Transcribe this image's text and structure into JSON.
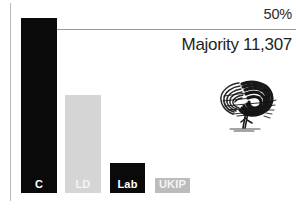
{
  "chart_data": {
    "type": "bar",
    "title": "",
    "xlabel": "",
    "ylabel": "",
    "categories": [
      "C",
      "LD",
      "Lab",
      "UKIP"
    ],
    "values": [
      50.0,
      28.0,
      8.6,
      4.3
    ],
    "ylim": [
      0,
      57
    ],
    "grid": true,
    "gridlines": [
      {
        "value": 50,
        "label": "50%"
      }
    ],
    "legend": "none",
    "series": [
      {
        "name": "Vote share",
        "values": [
          50.0,
          28.0,
          8.6,
          4.3
        ]
      }
    ],
    "bars": [
      {
        "category": "C",
        "label": "C",
        "value": 50.0,
        "color": "#0a0a0a",
        "label_color": "#ffffff"
      },
      {
        "category": "LD",
        "label": "LD",
        "value": 28.0,
        "color": "#d5d5d5",
        "label_color": "#f4f4f4"
      },
      {
        "category": "Lab",
        "label": "Lab",
        "value": 8.6,
        "color": "#0a0a0a",
        "label_color": "#ffffff"
      },
      {
        "category": "UKIP",
        "label": "UKIP",
        "value": 4.3,
        "color": "#bcbcbc",
        "label_color": "#f4f4f4"
      }
    ],
    "annotations": [
      {
        "name": "gridline-label",
        "text": "50%"
      },
      {
        "name": "majority-label",
        "text": "Majority 11,307"
      }
    ]
  },
  "axis": {
    "gridline_label": "50%"
  },
  "annotation": {
    "majority": "Majority 11,307"
  },
  "logo": {
    "name": "conservative-tree-logo",
    "alt": "Conservative Party scribbled oak tree logo"
  },
  "colors": {
    "bar_dark": "#0a0a0a",
    "bar_light_grey": "#d5d5d5",
    "bar_mid_grey": "#bcbcbc",
    "gridline": "#9a9a9a",
    "axis": "#b9b9b9",
    "text": "#231f20",
    "background": "#ffffff"
  }
}
